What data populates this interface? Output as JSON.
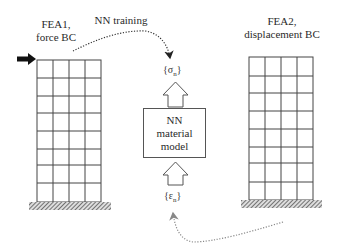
{
  "diagram": {
    "left_structure": {
      "title_line1": "FEA1,",
      "title_line2": "force BC",
      "columns": 4,
      "rows": 8,
      "load": "force-arrow"
    },
    "right_structure": {
      "title_line1": "FEA2,",
      "title_line2": "displacement BC",
      "columns": 4,
      "rows": 8
    },
    "center": {
      "box_line1": "NN",
      "box_line2": "material",
      "box_line3": "model",
      "output_symbol": "σ",
      "output_subscript": "n",
      "input_symbol": "ε",
      "input_subscript": "n"
    },
    "connectors": {
      "top_label": "NN training",
      "top_from": "FEA1",
      "top_to": "NN material model output",
      "bottom_from": "FEA2",
      "bottom_to": "NN material model input"
    },
    "colors": {
      "line": "#444444",
      "ground_hatch": "#555555",
      "force_arrow": "#111111",
      "dotted_top": "#333333",
      "dotted_bottom": "#888888"
    }
  }
}
